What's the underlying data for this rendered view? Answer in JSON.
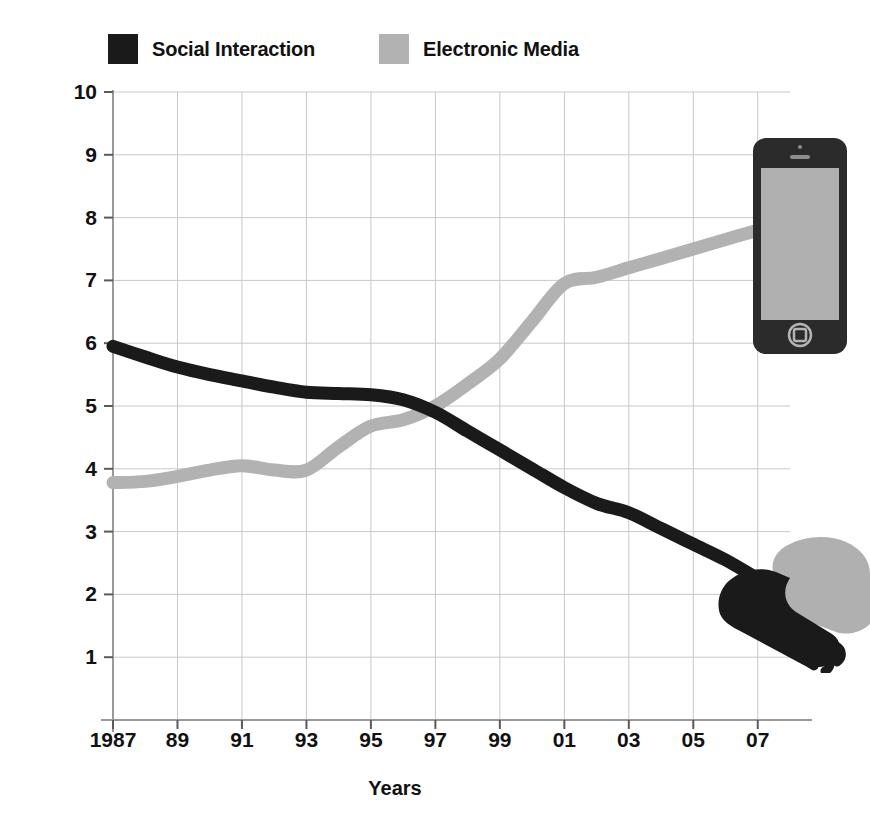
{
  "chart_data": {
    "type": "line",
    "title": "",
    "xlabel": "Years",
    "ylabel": "Hours/day",
    "xlim": [
      1987,
      2008
    ],
    "ylim": [
      0,
      10
    ],
    "grid": true,
    "legend_position": "top-left",
    "x_tick_labels": [
      "1987",
      "89",
      "91",
      "93",
      "95",
      "97",
      "99",
      "01",
      "03",
      "05",
      "07"
    ],
    "x_tick_values": [
      1987,
      1989,
      1991,
      1993,
      1995,
      1997,
      1999,
      2001,
      2003,
      2005,
      2007
    ],
    "y_tick_labels": [
      "1",
      "2",
      "3",
      "4",
      "5",
      "6",
      "7",
      "8",
      "9",
      "10"
    ],
    "y_tick_values": [
      1,
      2,
      3,
      4,
      5,
      6,
      7,
      8,
      9,
      10
    ],
    "x": [
      1987,
      1988,
      1989,
      1990,
      1991,
      1992,
      1993,
      1994,
      1995,
      1996,
      1997,
      1998,
      1999,
      2000,
      2001,
      2002,
      2003,
      2004,
      2005,
      2006,
      2007
    ],
    "series": [
      {
        "name": "Social Interaction",
        "color": "#1a1a1a",
        "values": [
          5.95,
          5.78,
          5.62,
          5.5,
          5.4,
          5.3,
          5.22,
          5.2,
          5.18,
          5.1,
          4.9,
          4.6,
          4.3,
          4.0,
          3.7,
          3.45,
          3.3,
          3.05,
          2.8,
          2.55,
          2.25
        ]
      },
      {
        "name": "Electronic Media",
        "color": "#b2b2b2",
        "values": [
          3.78,
          3.8,
          3.88,
          3.98,
          4.05,
          3.98,
          3.98,
          4.35,
          4.68,
          4.78,
          5.0,
          5.35,
          5.75,
          6.35,
          6.95,
          7.05,
          7.2,
          7.35,
          7.5,
          7.65,
          7.8
        ]
      }
    ]
  },
  "legend": {
    "items": [
      {
        "label": "Social Interaction",
        "color": "#1a1a1a"
      },
      {
        "label": "Electronic Media",
        "color": "#b2b2b2"
      }
    ]
  },
  "axes": {
    "y_title": "Hours/day",
    "x_title": "Years"
  },
  "decorations": [
    {
      "name": "smartphone-illustration",
      "colors": {
        "body": "#2b2b2b",
        "screen": "#b0b0b0"
      }
    },
    {
      "name": "handshake-illustration",
      "colors": {
        "dark_hand": "#1a1a1a",
        "light_hand": "#b0b0b0"
      }
    }
  ]
}
